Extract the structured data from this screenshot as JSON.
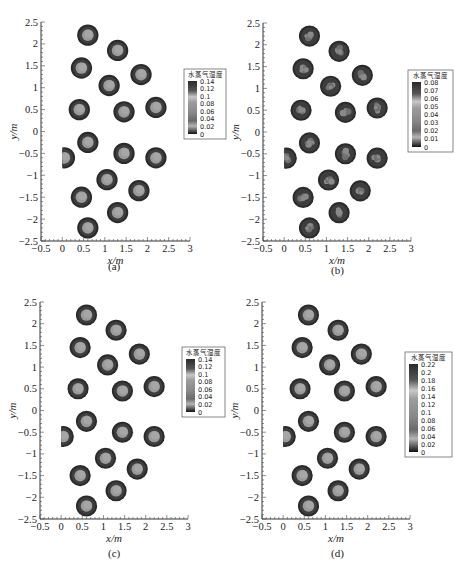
{
  "chart_data": [
    {
      "type": "heatmap",
      "panel_label": "(a)",
      "xlabel": "x/m",
      "ylabel": "y/m",
      "xlim": [
        -0.5,
        3
      ],
      "ylim": [
        -2.5,
        2.5
      ],
      "x_ticks": [
        "-0.5",
        "0",
        "0.5",
        "1",
        "1.5",
        "2",
        "2.5",
        "3"
      ],
      "y_ticks": [
        "2.5",
        "2",
        "1.5",
        "1",
        "0.5",
        "0",
        "-0.5",
        "-1",
        "-1.5",
        "-2",
        "-2.5"
      ],
      "legend_title": "水蒸气湿度",
      "legend_ticks": [
        "0.14",
        "0.12",
        "0.1",
        "0.08",
        "0.06",
        "0.04",
        "0.02",
        "0"
      ],
      "pattern": "smooth"
    },
    {
      "type": "heatmap",
      "panel_label": "(b)",
      "xlabel": "x/m",
      "ylabel": "y/m",
      "xlim": [
        -0.5,
        3
      ],
      "ylim": [
        -2.5,
        2.5
      ],
      "x_ticks": [
        "-0.5",
        "0",
        "0.5",
        "1",
        "1.5",
        "2",
        "2.5",
        "3"
      ],
      "y_ticks": [
        "2.5",
        "2",
        "1.5",
        "1",
        "0.5",
        "0",
        "-0.5",
        "-1",
        "-1.5",
        "-2",
        "-2.5"
      ],
      "legend_title": "水蒸气湿度",
      "legend_ticks": [
        "0.08",
        "0.07",
        "0.06",
        "0.05",
        "0.04",
        "0.03",
        "0.02",
        "0.01",
        "0"
      ],
      "pattern": "mottled"
    },
    {
      "type": "heatmap",
      "panel_label": "(c)",
      "xlabel": "x/m",
      "ylabel": "y/m",
      "xlim": [
        -0.5,
        3
      ],
      "ylim": [
        -2.5,
        2.5
      ],
      "x_ticks": [
        "-0.5",
        "0",
        "0.5",
        "1",
        "1.5",
        "2",
        "2.5",
        "3"
      ],
      "y_ticks": [
        "2.5",
        "2",
        "1.5",
        "1",
        "0.5",
        "0",
        "-0.5",
        "-1",
        "-1.5",
        "-2",
        "-2.5"
      ],
      "legend_title": "水蒸气湿度",
      "legend_ticks": [
        "0.14",
        "0.12",
        "0.1",
        "0.08",
        "0.06",
        "0.04",
        "0.02",
        "0"
      ],
      "pattern": "smooth"
    },
    {
      "type": "heatmap",
      "panel_label": "(d)",
      "xlabel": "x/m",
      "ylabel": "y/m",
      "xlim": [
        -0.5,
        3
      ],
      "ylim": [
        -2.5,
        2.5
      ],
      "x_ticks": [
        "-0.5",
        "0",
        "0.5",
        "1",
        "1.5",
        "2",
        "2.5",
        "3"
      ],
      "y_ticks": [
        "2.5",
        "2",
        "1.5",
        "1",
        "0.5",
        "0",
        "-0.5",
        "-1",
        "-1.5",
        "-2",
        "-2.5"
      ],
      "legend_title": "水蒸气湿度",
      "legend_ticks": [
        "0.22",
        "0.2",
        "0.18",
        "0.16",
        "0.14",
        "0.12",
        "0.1",
        "0.08",
        "0.06",
        "0.04",
        "0.02",
        "0"
      ],
      "pattern": "smooth"
    }
  ],
  "circles": [
    {
      "x": 0.6,
      "y": 2.2
    },
    {
      "x": 1.3,
      "y": 1.85
    },
    {
      "x": 0.45,
      "y": 1.45
    },
    {
      "x": 1.85,
      "y": 1.3
    },
    {
      "x": 1.1,
      "y": 1.05
    },
    {
      "x": 0.4,
      "y": 0.5
    },
    {
      "x": 1.45,
      "y": 0.45
    },
    {
      "x": 2.2,
      "y": 0.55
    },
    {
      "x": 0.6,
      "y": -0.25
    },
    {
      "x": 1.45,
      "y": -0.5
    },
    {
      "x": 2.2,
      "y": -0.6
    },
    {
      "x": 0.05,
      "y": -0.6,
      "half": true
    },
    {
      "x": 1.05,
      "y": -1.1
    },
    {
      "x": 1.8,
      "y": -1.35
    },
    {
      "x": 0.45,
      "y": -1.5
    },
    {
      "x": 1.3,
      "y": -1.85
    },
    {
      "x": 0.6,
      "y": -2.2
    }
  ],
  "circle_radius_m": 0.25
}
